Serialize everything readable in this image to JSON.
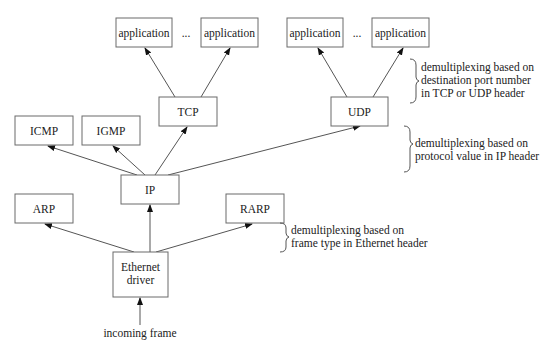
{
  "diagram": {
    "title": "",
    "nodes": {
      "app1": "application",
      "app2": "application",
      "app3": "application",
      "app4": "application",
      "tcp": "TCP",
      "udp": "UDP",
      "icmp": "ICMP",
      "igmp": "IGMP",
      "ip": "IP",
      "arp": "ARP",
      "rarp": "RARP",
      "ethernet_line1": "Ethernet",
      "ethernet_line2": "driver"
    },
    "ellipsis": "...",
    "input_label": "incoming frame",
    "annotations": {
      "transport": {
        "line1": "demultiplexing based on",
        "line2": "destination port number",
        "line3": "in TCP or UDP header"
      },
      "network": {
        "line1": "demultiplexing based on",
        "line2": "protocol value in IP header"
      },
      "link": {
        "line1": "demultiplexing based on",
        "line2": "frame type in Ethernet header"
      }
    },
    "edges": [
      {
        "from": "incoming frame",
        "to": "Ethernet driver"
      },
      {
        "from": "Ethernet driver",
        "to": "ARP"
      },
      {
        "from": "Ethernet driver",
        "to": "IP"
      },
      {
        "from": "Ethernet driver",
        "to": "RARP"
      },
      {
        "from": "IP",
        "to": "ICMP"
      },
      {
        "from": "IP",
        "to": "IGMP"
      },
      {
        "from": "IP",
        "to": "TCP"
      },
      {
        "from": "IP",
        "to": "UDP"
      },
      {
        "from": "TCP",
        "to": "application"
      },
      {
        "from": "TCP",
        "to": "application"
      },
      {
        "from": "UDP",
        "to": "application"
      },
      {
        "from": "UDP",
        "to": "application"
      }
    ]
  }
}
